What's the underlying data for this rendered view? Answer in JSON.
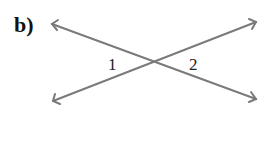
{
  "diagram": {
    "part_label": "b)",
    "angles": [
      {
        "id": "1",
        "label": "1"
      },
      {
        "id": "2",
        "label": "2"
      }
    ],
    "line_color": "#7a7a7a",
    "type": "vertical angles formed by two intersecting lines"
  }
}
